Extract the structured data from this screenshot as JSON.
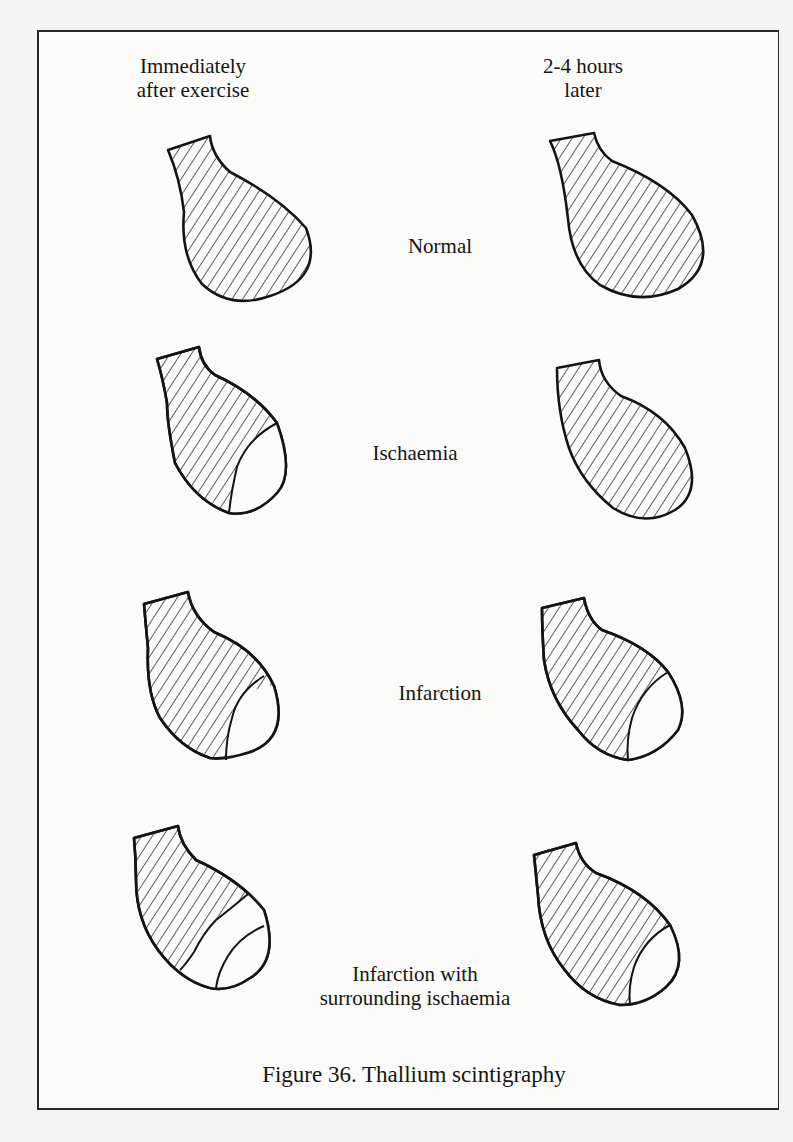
{
  "figure": {
    "caption": "Figure 36. Thallium scintigraphy",
    "columns": {
      "left_line1": "Immediately",
      "left_line2": "after exercise",
      "right_line1": "2-4 hours",
      "right_line2": "later"
    },
    "rows": [
      {
        "label_line1": "Normal",
        "label_line2": "",
        "after_exercise": "fully perfused (hatched)",
        "later": "fully perfused (hatched)"
      },
      {
        "label_line1": "Ischaemia",
        "label_line2": "",
        "after_exercise": "apical defect (unhatched)",
        "later": "fully perfused (hatched)"
      },
      {
        "label_line1": "Infarction",
        "label_line2": "",
        "after_exercise": "apical defect (unhatched)",
        "later": "apical defect persists (unhatched)"
      },
      {
        "label_line1": "Infarction with",
        "label_line2": "surrounding ischaemia",
        "after_exercise": "large defect: infarct plus ischaemic band",
        "later": "defect reduced to infarct only"
      }
    ],
    "colors": {
      "ink": "#141414",
      "paper": "#fbfbfa",
      "page": "#f4f4f2"
    }
  }
}
